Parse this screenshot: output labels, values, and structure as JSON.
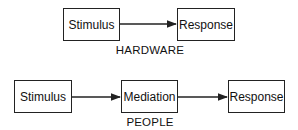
{
  "diagrams": [
    {
      "caption": "HARDWARE",
      "nodes": [
        "Stimulus",
        "Response"
      ],
      "edges": [
        [
          "Stimulus",
          "Response"
        ]
      ]
    },
    {
      "caption": "PEOPLE",
      "nodes": [
        "Stimulus",
        "Mediation",
        "Response"
      ],
      "edges": [
        [
          "Stimulus",
          "Mediation"
        ],
        [
          "Mediation",
          "Response"
        ]
      ]
    }
  ],
  "colors": {
    "line": "#222222",
    "background": "#ffffff"
  }
}
